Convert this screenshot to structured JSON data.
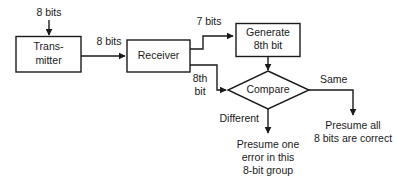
{
  "diagram": {
    "background_color": "#ffffff",
    "line_color": "#1a1a1a",
    "nodes": {
      "transmitter": {
        "line1": "Trans-",
        "line2": "mitter"
      },
      "receiver": {
        "line1": "Receiver"
      },
      "generate": {
        "line1": "Generate",
        "line2": "8th bit"
      },
      "compare": {
        "line1": "Compare"
      }
    },
    "edge_labels": {
      "input_8bits": "8 bits",
      "transmitter_to_receiver": "8 bits",
      "receiver_to_generate": "7 bits",
      "receiver_to_compare_line1": "8th",
      "receiver_to_compare_line2": "bit",
      "compare_same": "Same",
      "compare_different": "Different"
    },
    "terminals": {
      "error_outcome": {
        "line1": "Presume one",
        "line2": "error in this",
        "line3": "8-bit group"
      },
      "correct_outcome": {
        "line1": "Presume all",
        "line2": "8 bits are correct"
      }
    }
  }
}
